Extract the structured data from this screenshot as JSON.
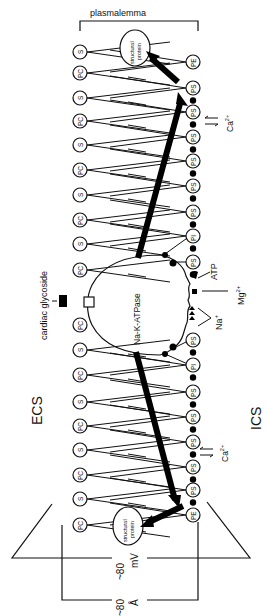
{
  "figure": {
    "title_label": "plasmalemma",
    "ecs_label": "ECS",
    "ics_label": "ICS",
    "enzyme_label": "Na-K-ATPase",
    "drug_label": "cardiac glycoside",
    "atp_label": "ATP",
    "mg_label": "Mg",
    "mg_charge": "2+",
    "na_label": "Na",
    "na_charge": "+",
    "ca_label": "Ca",
    "ca_charge": "2+",
    "structural_protein_line1": "structural",
    "structural_protein_line2": "protein",
    "thickness_potential": "~80 mV",
    "thickness_potential_value": "~80",
    "thickness_potential_unit": "mV",
    "thickness_distance": "~80 Å",
    "thickness_distance_value": "~80",
    "thickness_distance_unit": "Å",
    "outer_leaflet_heads": [
      {
        "label": "S",
        "y": 52
      },
      {
        "label": "PC",
        "y": 73
      },
      {
        "label": "S",
        "y": 98
      },
      {
        "label": "PC",
        "y": 121
      },
      {
        "label": "S",
        "y": 145
      },
      {
        "label": "PC",
        "y": 170
      },
      {
        "label": "S",
        "y": 195
      },
      {
        "label": "PC",
        "y": 220
      },
      {
        "label": "S",
        "y": 244
      },
      {
        "label": "PC",
        "y": 270
      },
      {
        "label": "PC",
        "y": 325
      },
      {
        "label": "S",
        "y": 350
      },
      {
        "label": "PC",
        "y": 375
      },
      {
        "label": "S",
        "y": 402
      },
      {
        "label": "PC",
        "y": 426
      },
      {
        "label": "S",
        "y": 450
      },
      {
        "label": "PC",
        "y": 475
      },
      {
        "label": "S",
        "y": 499
      },
      {
        "label": "PC",
        "y": 525
      }
    ],
    "inner_leaflet_heads": [
      {
        "label": "PE",
        "y": 62
      },
      {
        "label": "PS",
        "y": 88
      },
      {
        "label": "PS",
        "y": 112
      },
      {
        "label": "PS",
        "y": 137
      },
      {
        "label": "PS",
        "y": 161
      },
      {
        "label": "PS",
        "y": 186
      },
      {
        "label": "PS",
        "y": 212
      },
      {
        "label": "PI",
        "y": 236
      },
      {
        "label": "PS",
        "y": 262
      },
      {
        "label": "PS",
        "y": 340
      },
      {
        "label": "PI",
        "y": 365
      },
      {
        "label": "PS",
        "y": 392
      },
      {
        "label": "PS",
        "y": 417
      },
      {
        "label": "PS",
        "y": 442
      },
      {
        "label": "PS",
        "y": 467
      },
      {
        "label": "PS",
        "y": 490
      },
      {
        "label": "PE",
        "y": 515
      }
    ]
  }
}
